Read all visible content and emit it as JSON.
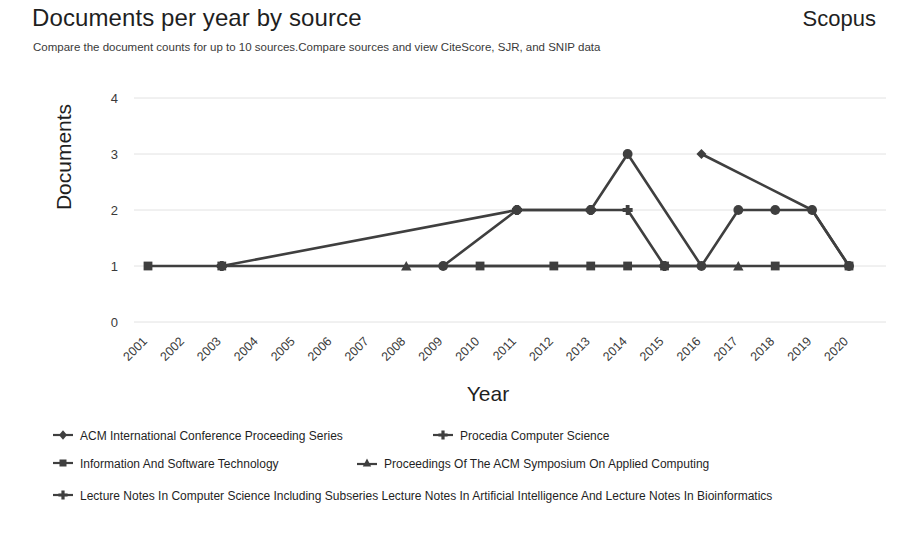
{
  "header": {
    "title": "Documents per year by source",
    "brand": "Scopus",
    "subtitle": "Compare the document counts for up to 10 sources.Compare sources and view CiteScore, SJR, and SNIP data"
  },
  "axes": {
    "ylabel": "Documents",
    "xlabel": "Year",
    "yticks": [
      "0",
      "1",
      "2",
      "3",
      "4"
    ],
    "xticks": [
      "2001",
      "2002",
      "2003",
      "2004",
      "2005",
      "2006",
      "2007",
      "2008",
      "2009",
      "2010",
      "2011",
      "2012",
      "2013",
      "2014",
      "2015",
      "2016",
      "2017",
      "2018",
      "2019",
      "2020"
    ]
  },
  "legend": {
    "items": [
      {
        "label": "ACM International Conference Proceeding Series",
        "marker": "diamond",
        "color": "#3f3f3f"
      },
      {
        "label": "Procedia Computer Science",
        "marker": "plus",
        "color": "#3f3f3f"
      },
      {
        "label": "Information And Software Technology",
        "marker": "square",
        "color": "#3f3f3f"
      },
      {
        "label": "Proceedings Of The ACM Symposium On Applied Computing",
        "marker": "triangle",
        "color": "#3f3f3f"
      },
      {
        "label": "Lecture Notes In Computer Science Including Subseries Lecture Notes In Artificial Intelligence And Lecture Notes In Bioinformatics",
        "marker": "cross",
        "color": "#3f3f3f"
      }
    ]
  },
  "chart_data": {
    "type": "line",
    "title": "Documents per year by source",
    "xlabel": "Year",
    "ylabel": "Documents",
    "ylim": [
      0,
      4
    ],
    "grid": true,
    "legend_position": "bottom",
    "categories": [
      "2001",
      "2002",
      "2003",
      "2004",
      "2005",
      "2006",
      "2007",
      "2008",
      "2009",
      "2010",
      "2011",
      "2012",
      "2013",
      "2014",
      "2015",
      "2016",
      "2017",
      "2018",
      "2019",
      "2020"
    ],
    "series": [
      {
        "name": "ACM International Conference Proceeding Series",
        "marker": "diamond",
        "color": "#3f3f3f",
        "points": [
          {
            "x": "2016",
            "y": 3
          },
          {
            "x": "2019",
            "y": 2
          },
          {
            "x": "2020",
            "y": 1
          }
        ]
      },
      {
        "name": "Procedia Computer Science",
        "marker": "plus",
        "color": "#3f3f3f",
        "points": [
          {
            "x": "2003",
            "y": 1
          },
          {
            "x": "2011",
            "y": 2
          },
          {
            "x": "2013",
            "y": 2
          },
          {
            "x": "2014",
            "y": 2
          },
          {
            "x": "2015",
            "y": 1
          }
        ]
      },
      {
        "name": "Information And Software Technology",
        "marker": "square",
        "color": "#3f3f3f",
        "points": [
          {
            "x": "2001",
            "y": 1
          },
          {
            "x": "2003",
            "y": 1
          },
          {
            "x": "2010",
            "y": 1
          },
          {
            "x": "2012",
            "y": 1
          },
          {
            "x": "2013",
            "y": 1
          },
          {
            "x": "2014",
            "y": 1
          },
          {
            "x": "2015",
            "y": 1
          },
          {
            "x": "2018",
            "y": 1
          },
          {
            "x": "2020",
            "y": 1
          }
        ]
      },
      {
        "name": "Proceedings Of The ACM Symposium On Applied Computing",
        "marker": "triangle",
        "color": "#3f3f3f",
        "points": [
          {
            "x": "2008",
            "y": 1
          },
          {
            "x": "2017",
            "y": 1
          }
        ]
      },
      {
        "name": "Lecture Notes In Computer Science Including Subseries Lecture Notes In Artificial Intelligence And Lecture Notes In Bioinformatics",
        "marker": "circle",
        "color": "#3f3f3f",
        "points": [
          {
            "x": "2009",
            "y": 1
          },
          {
            "x": "2011",
            "y": 2
          },
          {
            "x": "2013",
            "y": 2
          },
          {
            "x": "2014",
            "y": 3
          },
          {
            "x": "2016",
            "y": 1
          },
          {
            "x": "2017",
            "y": 2
          },
          {
            "x": "2018",
            "y": 2
          },
          {
            "x": "2019",
            "y": 2
          },
          {
            "x": "2020",
            "y": 1
          }
        ]
      }
    ]
  }
}
